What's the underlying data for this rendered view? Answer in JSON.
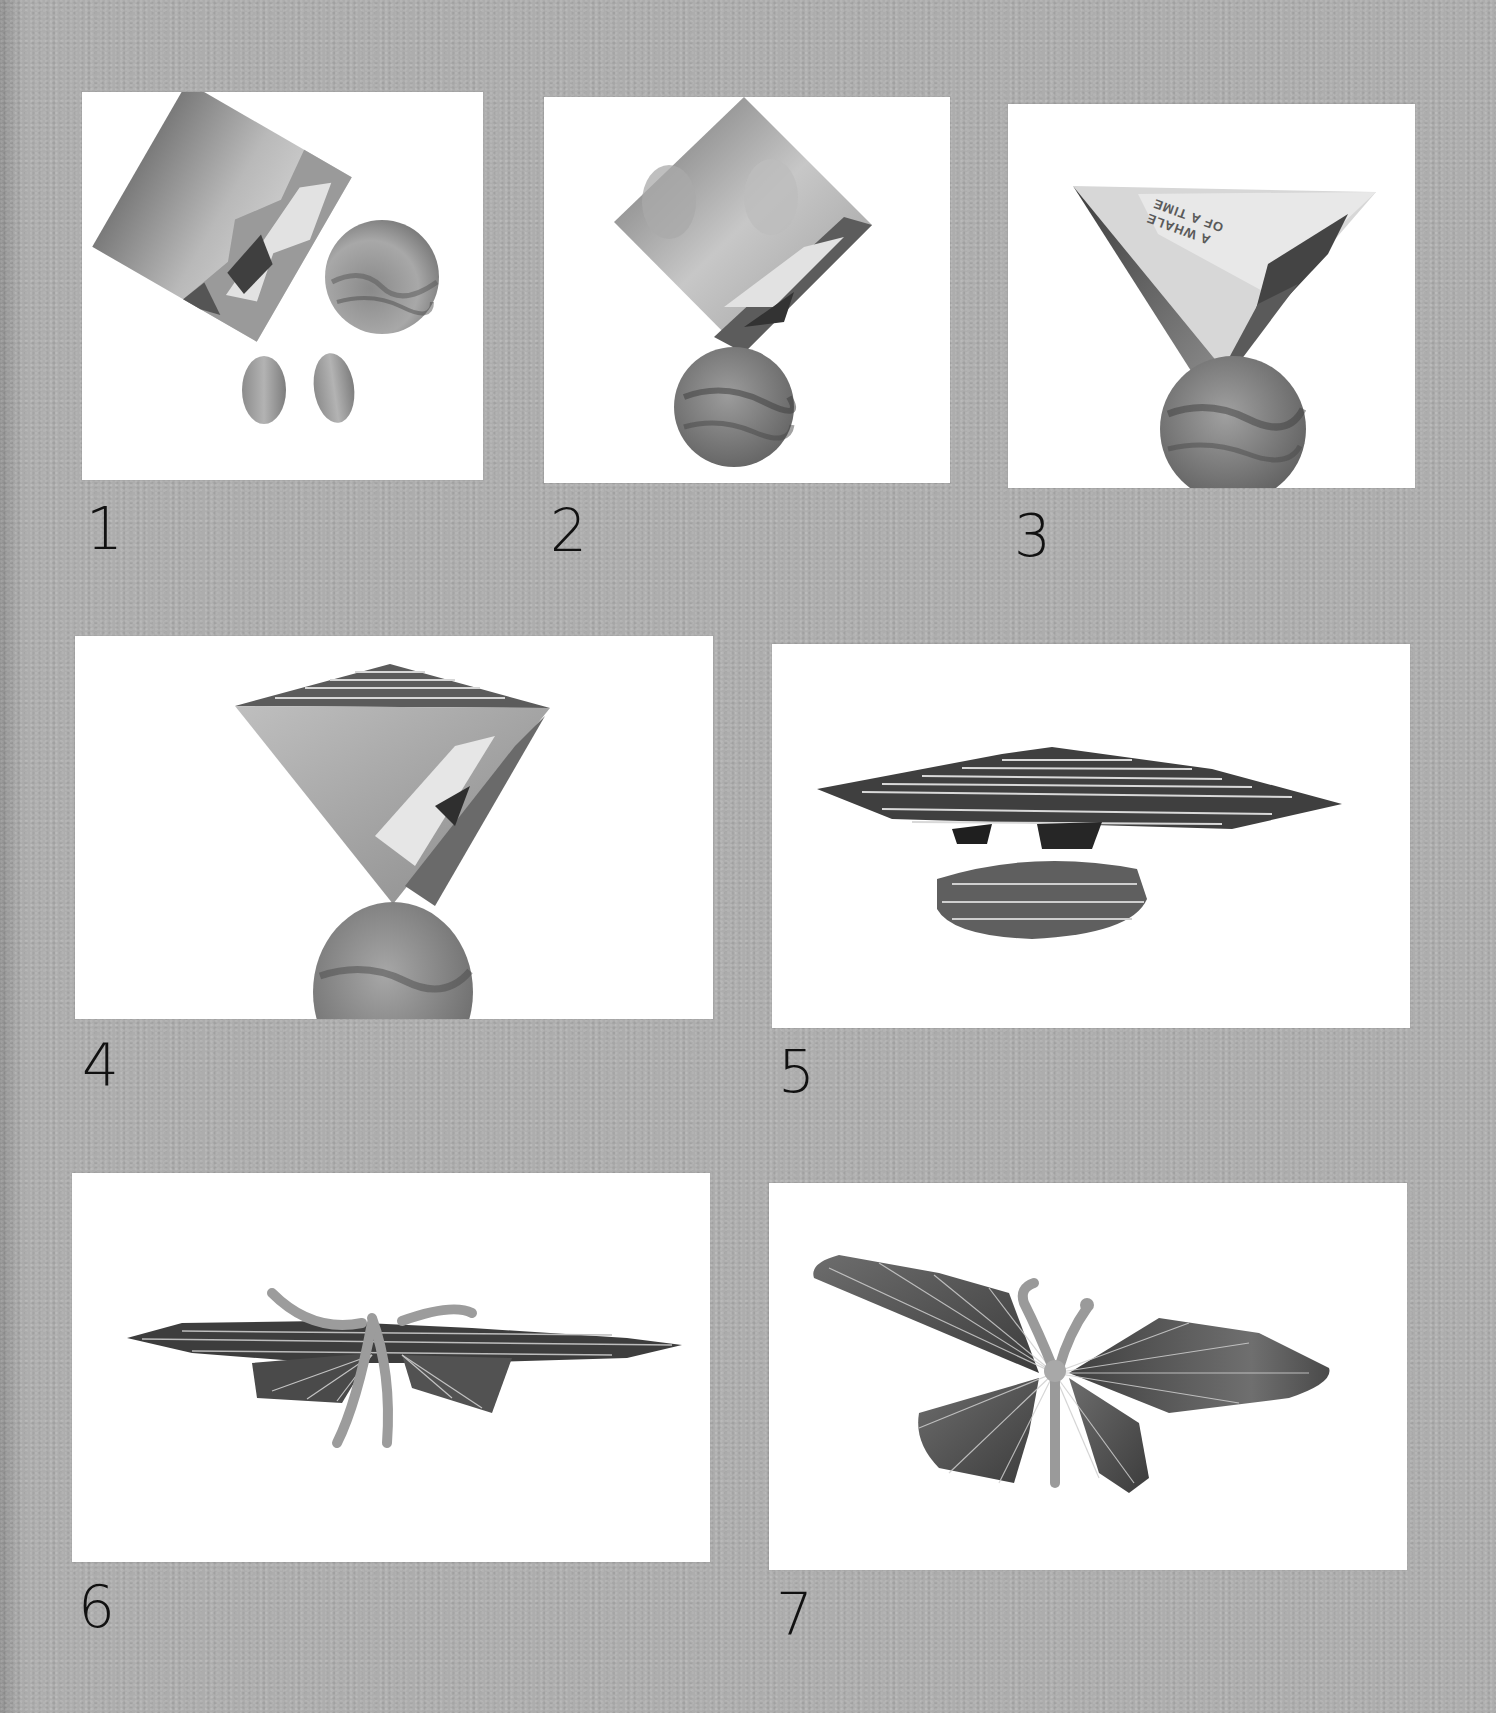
{
  "page": {
    "background_color": "#adadad",
    "panel_color": "#ffffff",
    "label_color": "#111111"
  },
  "steps": [
    {
      "number": "1",
      "caption": "Square of magazine paper, circle and two ovals cut out"
    },
    {
      "number": "2",
      "caption": "Ovals glued onto square turned as diamond, circle placed below"
    },
    {
      "number": "3",
      "caption": "Diamond folded in half into a triangle"
    },
    {
      "number": "4",
      "caption": "Triangle pleated from the top edge"
    },
    {
      "number": "5",
      "caption": "Triangle and circle both folded concertina-style"
    },
    {
      "number": "6",
      "caption": "Pleated pieces joined with a pipe cleaner"
    },
    {
      "number": "7",
      "caption": "Wings fanned out into a finished butterfly"
    }
  ],
  "printed_text": {
    "line1": "A WHALE",
    "line2": "OF A TIME"
  }
}
